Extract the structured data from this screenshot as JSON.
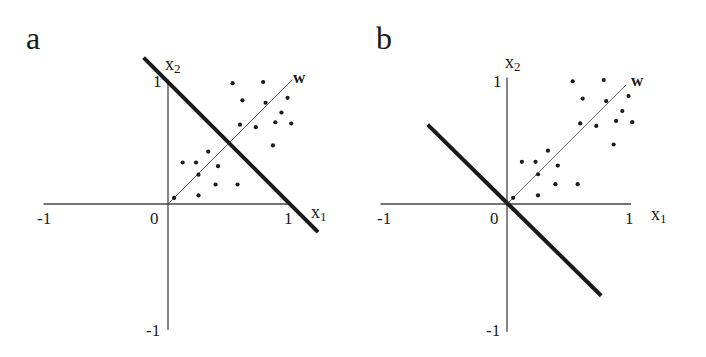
{
  "figure": {
    "panels": [
      {
        "id": "a",
        "letter": "a",
        "origin_px": [
          168,
          204
        ],
        "unit_px": 122,
        "tick_labels": {
          "x_neg": "-1",
          "origin": "0",
          "x_pos": "1",
          "y_pos": "1",
          "y_neg": "-1"
        },
        "axis_names": {
          "x": "x",
          "x_sub": "1",
          "y": "x",
          "y_sub": "2"
        },
        "weight_label": "w",
        "decision_boundary": {
          "description": "x1 + x2 = 1 (thick line)",
          "from": [
            -0.2,
            1.2
          ],
          "to": [
            1.23,
            -0.23
          ]
        },
        "weight_vector": {
          "from": [
            0,
            0
          ],
          "to": [
            1.02,
            1.02
          ]
        }
      },
      {
        "id": "b",
        "letter": "b",
        "origin_px": [
          507,
          204
        ],
        "unit_px": 124,
        "tick_labels": {
          "x_neg": "-1",
          "origin": "0",
          "x_pos": "1",
          "y_pos": "1",
          "y_neg": "-1"
        },
        "axis_names": {
          "x": "x",
          "x_sub": "1",
          "y": "x",
          "y_sub": "2"
        },
        "weight_label": "w",
        "decision_boundary": {
          "description": "x1 + x2 = 0 (thick line through origin)",
          "from": [
            -0.64,
            0.64
          ],
          "to": [
            0.76,
            -0.74
          ]
        },
        "weight_vector": {
          "from": [
            0,
            0
          ],
          "to": [
            0.96,
            0.96
          ]
        }
      }
    ],
    "points": [
      [
        0.53,
        0.99
      ],
      [
        0.78,
        1.0
      ],
      [
        0.61,
        0.85
      ],
      [
        0.8,
        0.83
      ],
      [
        0.98,
        0.87
      ],
      [
        0.93,
        0.75
      ],
      [
        0.88,
        0.67
      ],
      [
        1.01,
        0.66
      ],
      [
        0.59,
        0.65
      ],
      [
        0.72,
        0.63
      ],
      [
        0.86,
        0.48
      ],
      [
        0.33,
        0.43
      ],
      [
        0.23,
        0.34
      ],
      [
        0.12,
        0.34
      ],
      [
        0.41,
        0.31
      ],
      [
        0.25,
        0.24
      ],
      [
        0.39,
        0.16
      ],
      [
        0.57,
        0.16
      ],
      [
        0.25,
        0.07
      ],
      [
        0.05,
        0.05
      ]
    ],
    "colors": {
      "ink": "#1a1a1a",
      "axis": "#444444",
      "thin": "#555555",
      "background": "#ffffff"
    }
  }
}
